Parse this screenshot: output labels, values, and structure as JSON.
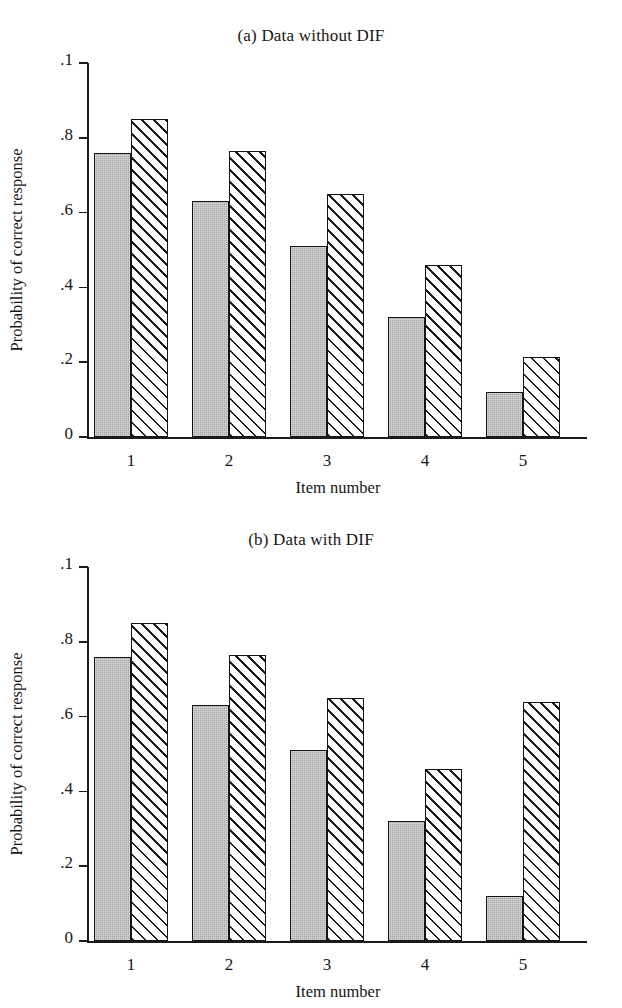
{
  "figure": {
    "axis_label_y": "Probability of correct response",
    "axis_label_x": "Item number",
    "y_ticks": [
      ".1",
      ".8",
      ".6",
      ".4",
      ".2",
      "0"
    ],
    "colors": {
      "series_1_fill": "#a9a9a9",
      "series_2_fill": "#ffffff",
      "outline": "#141414",
      "hatch": "#1b1b1b",
      "background": "#ffffff"
    }
  },
  "panels": [
    {
      "title": "(a) Data without DIF",
      "chart_data": {
        "type": "bar",
        "title": "(a) Data without DIF",
        "xlabel": "Item number",
        "ylabel": "Probability of correct response",
        "categories": [
          "1",
          "2",
          "3",
          "4",
          "5"
        ],
        "ylim": [
          0,
          1
        ],
        "ytick_values": [
          1.0,
          0.8,
          0.6,
          0.4,
          0.2,
          0.0
        ],
        "ytick_labels": [
          ".1",
          ".8",
          ".6",
          ".4",
          ".2",
          "0"
        ],
        "grid": false,
        "legend": "none",
        "series": [
          {
            "name": "reference-group",
            "style": "solid-gray",
            "values": [
              0.76,
              0.63,
              0.51,
              0.32,
              0.12
            ]
          },
          {
            "name": "focal-group",
            "style": "diagonal-hatch",
            "values": [
              0.85,
              0.765,
              0.65,
              0.46,
              0.215
            ]
          }
        ]
      }
    },
    {
      "title": "(b) Data with DIF",
      "chart_data": {
        "type": "bar",
        "title": "(b) Data with DIF",
        "xlabel": "Item number",
        "ylabel": "Probability of correct response",
        "categories": [
          "1",
          "2",
          "3",
          "4",
          "5"
        ],
        "ylim": [
          0,
          1
        ],
        "ytick_values": [
          1.0,
          0.8,
          0.6,
          0.4,
          0.2,
          0.0
        ],
        "ytick_labels": [
          ".1",
          ".8",
          ".6",
          ".4",
          ".2",
          "0"
        ],
        "grid": false,
        "legend": "none",
        "series": [
          {
            "name": "reference-group",
            "style": "solid-gray",
            "values": [
              0.76,
              0.63,
              0.51,
              0.32,
              0.12
            ]
          },
          {
            "name": "focal-group",
            "style": "diagonal-hatch",
            "values": [
              0.85,
              0.765,
              0.65,
              0.46,
              0.64
            ]
          }
        ]
      }
    }
  ]
}
